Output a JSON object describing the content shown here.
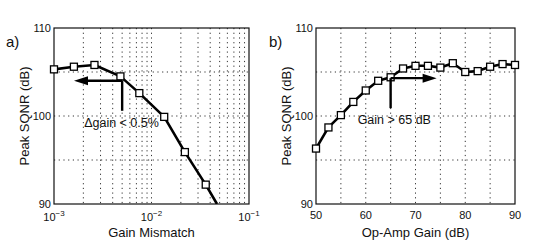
{
  "chart_data": [
    {
      "panel_label": "a)",
      "type": "line",
      "title": "",
      "xlabel": "Gain Mismatch",
      "ylabel": "Peak SQNR (dB)",
      "xscale": "log",
      "xlim": [
        0.001,
        0.1
      ],
      "ylim": [
        90,
        110
      ],
      "x_tick_labels": [
        "10^-3",
        "10^-2",
        "10^-1"
      ],
      "y_tick_labels": [
        "90",
        "100",
        "110"
      ],
      "grid": true,
      "series": [
        {
          "name": "Peak SQNR",
          "marker": "square",
          "x": [
            0.001,
            0.0016,
            0.0026,
            0.0048,
            0.0075,
            0.0135,
            0.022,
            0.036
          ],
          "y": [
            105.3,
            105.6,
            105.8,
            104.5,
            102.6,
            99.9,
            95.9,
            92.2
          ]
        }
      ],
      "curve_end": {
        "x": 0.047,
        "y": 90
      },
      "annotation": {
        "text": "Δgain < 0.5%",
        "arrow": "left",
        "x": 0.005,
        "y": 104
      }
    },
    {
      "panel_label": "b)",
      "type": "line",
      "title": "",
      "xlabel": "Op-Amp Gain (dB)",
      "ylabel": "Peak SQNR (dB)",
      "xscale": "linear",
      "xlim": [
        50,
        90
      ],
      "ylim": [
        90,
        110
      ],
      "x_tick_labels": [
        "50",
        "60",
        "70",
        "80",
        "90"
      ],
      "y_tick_labels": [
        "90",
        "100",
        "110"
      ],
      "grid": true,
      "series": [
        {
          "name": "Peak SQNR",
          "marker": "square",
          "x": [
            50,
            52.5,
            55,
            57.5,
            60,
            62.5,
            65,
            67.5,
            70,
            72.5,
            75,
            77.5,
            80,
            82.5,
            85,
            87.5,
            90
          ],
          "y": [
            96.3,
            98.7,
            100.1,
            101.6,
            102.9,
            104.0,
            104.4,
            105.4,
            105.7,
            105.7,
            105.5,
            106.0,
            105.0,
            105.1,
            105.6,
            105.9,
            105.8
          ]
        }
      ],
      "annotation": {
        "text": "Gain > 65 dB",
        "arrow": "right",
        "x": 65,
        "y": 104.3
      }
    }
  ]
}
